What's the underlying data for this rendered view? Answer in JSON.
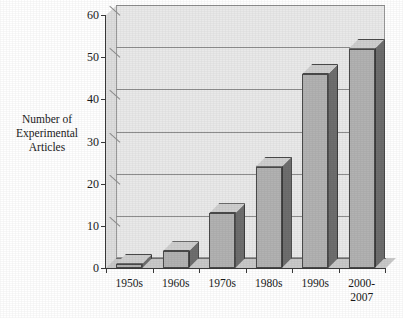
{
  "chart_data": {
    "type": "bar",
    "title": "",
    "subtitle": "",
    "xlabel": "",
    "ylabel": "Number of Experimental Articles",
    "ylabel_lines": [
      "Number of",
      "Experimental",
      "Articles"
    ],
    "categories": [
      "1950s",
      "1960s",
      "1970s",
      "1980s",
      "1990s",
      "2000-2007"
    ],
    "category_lines": [
      [
        "1950s"
      ],
      [
        "1960s"
      ],
      [
        "1970s"
      ],
      [
        "1980s"
      ],
      [
        "1990s"
      ],
      [
        "2000-",
        "2007"
      ]
    ],
    "values": [
      1,
      4,
      13,
      24,
      46,
      52
    ],
    "ylim": [
      0,
      60
    ],
    "ytick_step": 10,
    "yticks": [
      0,
      10,
      20,
      30,
      40,
      50,
      60
    ],
    "ytick_labels": [
      "0",
      "10",
      "20",
      "30",
      "40",
      "50",
      "60"
    ],
    "grid": true,
    "grid_axis": "y",
    "legend": false,
    "legend_position": "none",
    "style": "3d-column",
    "colors": {
      "bar_face": "#b2b2b2",
      "bar_side": "#6e6e6e",
      "bar_top": "#cfcfcf",
      "plot_background": "#e9e9e9",
      "floor": "#c9c9c9",
      "left_wall": "#dedede",
      "gridline": "#8d8d8d",
      "axis": "#3a3a3a",
      "text": "#1a1a1a",
      "page_background": "#ffffff"
    }
  }
}
